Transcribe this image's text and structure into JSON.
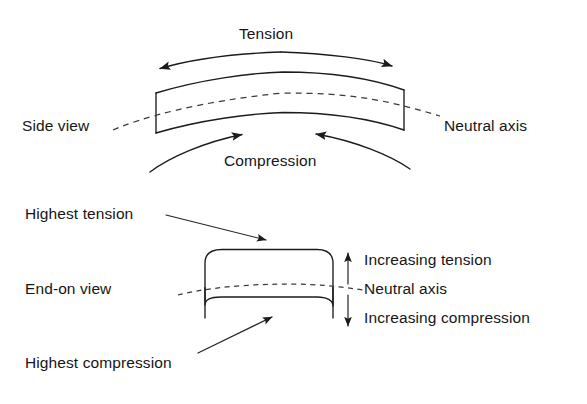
{
  "figure": {
    "kind": "engineering-diagram"
  },
  "side_view": {
    "view_label": "Side view",
    "top_label": "Tension",
    "bottom_label": "Compression",
    "neutral_axis_label": "Neutral axis"
  },
  "end_on_view": {
    "view_label": "End-on view",
    "highest_tension_label": "Highest tension",
    "highest_compression_label": "Highest compression",
    "increasing_tension_label": "Increasing tension",
    "neutral_axis_label": "Neutral axis",
    "increasing_compression_label": "Increasing compression"
  },
  "colors": {
    "ink": "#1b1b1b",
    "dashed": "#3a3a3a",
    "background": "#ffffff"
  }
}
